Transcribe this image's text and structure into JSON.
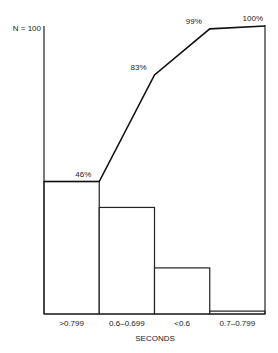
{
  "chart_data": {
    "type": "bar",
    "subtype": "pareto",
    "title": "",
    "xlabel": "SECONDS",
    "ylabel": "",
    "n_label": "N = 100",
    "categories": [
      ">0.799",
      "0.6–0.699",
      "<0.6",
      "0.7–0.799"
    ],
    "series": [
      {
        "name": "frequency",
        "type": "bar",
        "values": [
          46,
          37,
          16,
          1
        ]
      },
      {
        "name": "cumulative percent",
        "type": "line",
        "values": [
          46,
          83,
          99,
          100
        ],
        "labels": [
          "46%",
          "83%",
          "99%",
          "100%"
        ]
      }
    ],
    "ylim": [
      0,
      100
    ],
    "grid": false,
    "legend": "none"
  }
}
